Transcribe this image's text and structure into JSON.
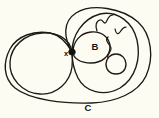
{
  "figure": {
    "kind": "hand-drawn-topology-diagram",
    "background_color": "#fcfcf3",
    "ink_color": "#1d1a16",
    "width": 159,
    "height": 118,
    "labels": [
      {
        "id": "x",
        "text": "x",
        "x": 66,
        "y": 53.5,
        "size": 7.5,
        "italic": false,
        "role": "singular-point-label"
      },
      {
        "id": "B",
        "text": "B",
        "x": 95,
        "y": 47,
        "size": 9,
        "role": "inner-region-label"
      },
      {
        "id": "C",
        "text": "C",
        "x": 88,
        "y": 108,
        "size": 9,
        "role": "outer-curve-label"
      }
    ],
    "shapes": [
      {
        "id": "outer-ellipse",
        "name": "outer-curve-C",
        "type": "ellipse",
        "cx": 79,
        "cy": 55,
        "rx": 72,
        "ry": 48,
        "rotation": -4
      },
      {
        "id": "left-circle",
        "name": "left-lobe-circle",
        "type": "ellipse",
        "cx": 42,
        "cy": 63,
        "rx": 32,
        "ry": 31,
        "rotation": 0
      },
      {
        "id": "right-circle",
        "name": "right-lobe-circle",
        "type": "ellipse",
        "cx": 104,
        "cy": 52,
        "rx": 34,
        "ry": 40,
        "rotation": 0
      },
      {
        "id": "b-circle",
        "name": "region-B-circle",
        "type": "ellipse",
        "cx": 91,
        "cy": 47,
        "rx": 19,
        "ry": 16,
        "rotation": 0
      },
      {
        "id": "small-circle",
        "name": "small-circle",
        "type": "ellipse",
        "cx": 116,
        "cy": 64,
        "rx": 10,
        "ry": 10,
        "rotation": 0
      }
    ],
    "node": {
      "id": "x-node",
      "name": "singular-point-node",
      "x": 72,
      "y": 52,
      "rx": 3.4,
      "ry": 3.0
    },
    "squiggles": [
      {
        "id": "squiggle-upper",
        "name": "upper-wavy-arc",
        "from": [
          97,
          31
        ],
        "to": [
          114,
          13
        ]
      },
      {
        "id": "squiggle-small",
        "name": "small-wavy-tick",
        "from": [
          115,
          30
        ],
        "to": [
          126,
          27
        ]
      },
      {
        "id": "squiggle-side",
        "name": "right-side-wavy-line",
        "from": [
          108,
          37
        ],
        "to": [
          110,
          59
        ]
      }
    ]
  }
}
